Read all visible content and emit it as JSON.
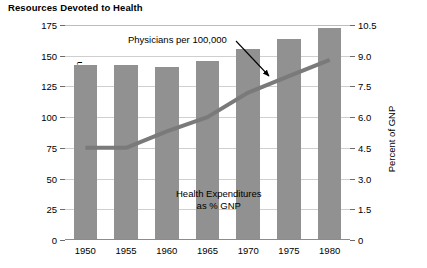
{
  "chart_data": {
    "type": "bar",
    "title": "Resources Devoted to Health",
    "xlabel": "",
    "ylabel": "Physicians per 100,000 population",
    "y2label": "Percent of GNP",
    "categories": [
      "1950",
      "1955",
      "1960",
      "1965",
      "1970",
      "1975",
      "1980"
    ],
    "ylim": [
      0,
      175
    ],
    "y2lim": [
      0,
      10.5
    ],
    "yticks": [
      "0",
      "25",
      "50",
      "75",
      "100",
      "125",
      "150",
      "175"
    ],
    "ytick_values": [
      0,
      25,
      50,
      75,
      100,
      125,
      150,
      175
    ],
    "y2ticks": [
      "0",
      "1.5",
      "3.0",
      "4.5",
      "6.0",
      "7.5",
      "9.0",
      "10.5"
    ],
    "y2tick_values": [
      0,
      1.5,
      3.0,
      4.5,
      6.0,
      7.5,
      9.0,
      10.5
    ],
    "grid": true,
    "legend": "none",
    "series": [
      {
        "name": "Physicians per 100,000",
        "type": "bar",
        "axis": "left",
        "values": [
          142,
          142,
          140,
          145,
          155,
          163,
          172
        ]
      },
      {
        "name": "Health Expenditures as % GNP",
        "type": "line",
        "axis": "right",
        "values": [
          4.5,
          4.5,
          5.3,
          6.0,
          7.2,
          8.0,
          8.8
        ]
      }
    ],
    "annotations": [
      {
        "text": "Physicians per 100,000",
        "target": "bar-series"
      },
      {
        "text": "Health Expenditures",
        "text2": "as % GNP",
        "target": "line-series"
      }
    ],
    "colors": {
      "bar": "#919191",
      "line": "#7a7a7a",
      "grid": "#cfcfcf",
      "axis": "#8c8c8c",
      "text": "#000000"
    }
  }
}
